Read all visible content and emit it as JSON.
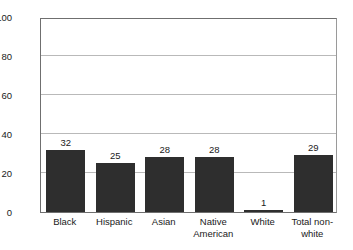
{
  "chart_data": {
    "type": "bar",
    "title": "",
    "subtitle": "",
    "xlabel": "",
    "ylabel": "",
    "ylim": [
      0,
      100
    ],
    "yticks": [
      0,
      20,
      40,
      60,
      80,
      100
    ],
    "ytick_labels": [
      "0",
      "20",
      "40",
      "60",
      "80",
      "100"
    ],
    "grid": "horizontal",
    "legend": "none",
    "bar_color": "#2e2e2e",
    "gridline_color": "#b9b9b9",
    "axis_color": "#6f6f6f",
    "categories": [
      "Black",
      "Hispanic",
      "Asian",
      "Native American",
      "White",
      "Total non-white"
    ],
    "category_lines": [
      [
        "Black"
      ],
      [
        "Hispanic"
      ],
      [
        "Asian"
      ],
      [
        "Native",
        "American"
      ],
      [
        "White"
      ],
      [
        "Total non-",
        "white"
      ]
    ],
    "values": [
      32,
      25,
      28,
      28,
      1,
      29
    ],
    "value_labels": [
      "32",
      "25",
      "28",
      "28",
      "1",
      "29"
    ]
  }
}
